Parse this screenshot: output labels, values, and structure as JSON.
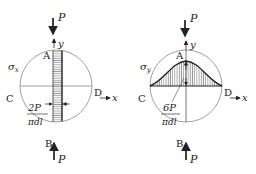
{
  "figure": {
    "left_panel": {
      "stress_label": "σ",
      "stress_sub": "x",
      "load_label": "P",
      "axis_y": "y",
      "axis_x": "x",
      "point_A": "A",
      "point_B": "B",
      "point_C": "C",
      "point_D": "D",
      "value_num": "2P",
      "value_den": "πdl",
      "distribution": "uniform tensile strip along vertical diameter"
    },
    "right_panel": {
      "stress_label": "σ",
      "stress_sub": "y",
      "load_label": "P",
      "axis_y": "y",
      "axis_x": "x",
      "point_A": "A",
      "point_B": "B",
      "point_C": "C",
      "point_D": "D",
      "value_num": "6P",
      "value_den": "πdl",
      "distribution": "bell-shaped compressive distribution along horizontal diameter"
    },
    "colors": {
      "line": "#333333",
      "circle": "#888888",
      "hatch": "#555555"
    }
  }
}
